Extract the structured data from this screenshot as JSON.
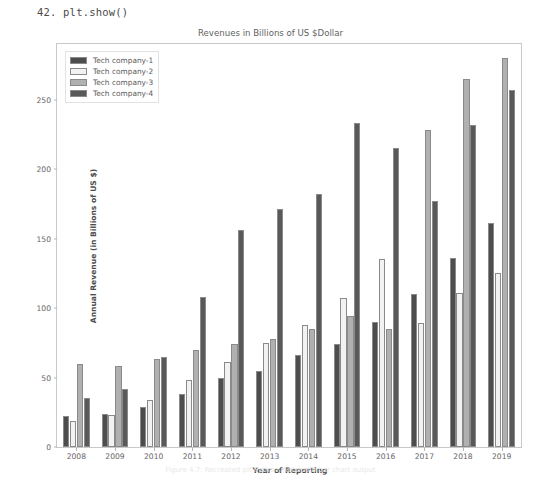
{
  "code_line": "42. plt.show()",
  "caption": "Figure 4.7: Recreated plt.Python matplotlib bar chart output",
  "chart_data": {
    "type": "bar",
    "title": "Revenues in Billions of US $Dollar",
    "xlabel": "Year of Reporting",
    "ylabel": "Annual Revenue (in Billions of US $)",
    "categories": [
      "2008",
      "2009",
      "2010",
      "2011",
      "2012",
      "2013",
      "2014",
      "2015",
      "2016",
      "2017",
      "2018",
      "2019"
    ],
    "ylim": [
      0,
      290
    ],
    "yticks": [
      0,
      50,
      100,
      150,
      200,
      250
    ],
    "grid": false,
    "legend_position": "upper left",
    "series": [
      {
        "name": "Tech company-1",
        "color": "#4d4d4d",
        "values": [
          22,
          24,
          29,
          38,
          50,
          55,
          66,
          74,
          90,
          110,
          136,
          161
        ]
      },
      {
        "name": "Tech company-2",
        "color": "#f2f2f2",
        "values": [
          19,
          23,
          34,
          48,
          61,
          75,
          88,
          107,
          135,
          89,
          111,
          125
        ]
      },
      {
        "name": "Tech company-3",
        "color": "#b0b0b0",
        "values": [
          60,
          58,
          63,
          70,
          74,
          78,
          85,
          94,
          85,
          228,
          265,
          280
        ]
      },
      {
        "name": "Tech company-4",
        "color": "#595959",
        "values": [
          35,
          42,
          65,
          108,
          156,
          171,
          182,
          233,
          215,
          177,
          232,
          257
        ]
      }
    ]
  }
}
